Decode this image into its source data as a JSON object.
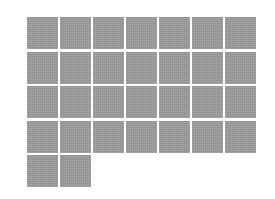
{
  "gallery": {
    "columns": 7,
    "tile_count": 30,
    "tile_color": "#9c9c9c",
    "background_color": "#ffffff",
    "tiles": [
      {
        "row": 1,
        "col": 1
      },
      {
        "row": 1,
        "col": 2
      },
      {
        "row": 1,
        "col": 3
      },
      {
        "row": 1,
        "col": 4
      },
      {
        "row": 1,
        "col": 5
      },
      {
        "row": 1,
        "col": 6
      },
      {
        "row": 1,
        "col": 7
      },
      {
        "row": 2,
        "col": 1
      },
      {
        "row": 2,
        "col": 2
      },
      {
        "row": 2,
        "col": 3
      },
      {
        "row": 2,
        "col": 4
      },
      {
        "row": 2,
        "col": 5
      },
      {
        "row": 2,
        "col": 6
      },
      {
        "row": 2,
        "col": 7
      },
      {
        "row": 3,
        "col": 1
      },
      {
        "row": 3,
        "col": 2
      },
      {
        "row": 3,
        "col": 3
      },
      {
        "row": 3,
        "col": 4
      },
      {
        "row": 3,
        "col": 5
      },
      {
        "row": 3,
        "col": 6
      },
      {
        "row": 3,
        "col": 7
      },
      {
        "row": 4,
        "col": 1
      },
      {
        "row": 4,
        "col": 2
      },
      {
        "row": 4,
        "col": 3
      },
      {
        "row": 4,
        "col": 4
      },
      {
        "row": 4,
        "col": 5
      },
      {
        "row": 4,
        "col": 6
      },
      {
        "row": 4,
        "col": 7
      },
      {
        "row": 5,
        "col": 1
      },
      {
        "row": 5,
        "col": 2
      }
    ]
  }
}
